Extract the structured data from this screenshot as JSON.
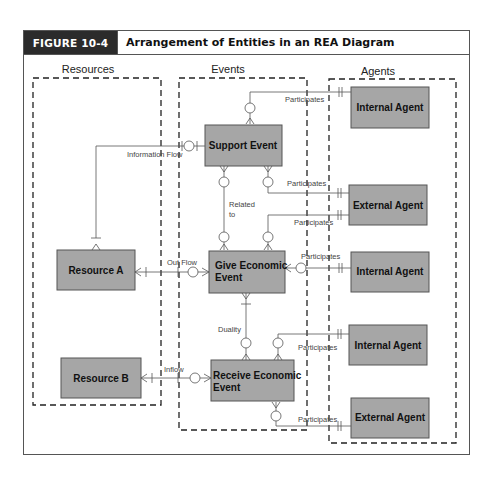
{
  "header": {
    "figure_label": "FIGURE 10-4",
    "title": "Arrangement of Entities in an REA Diagram"
  },
  "columns": {
    "resources": "Resources",
    "events": "Events",
    "agents": "Agents"
  },
  "entities": {
    "resource_a": "Resource A",
    "resource_b": "Resource B",
    "support_event": "Support Event",
    "give_event_line1": "Give Economic",
    "give_event_line2": "Event",
    "receive_event_line1": "Receive Economic",
    "receive_event_line2": "Event",
    "internal_agent_1": "Internal Agent",
    "external_agent_1": "External Agent",
    "internal_agent_2": "Internal Agent",
    "internal_agent_3": "Internal Agent",
    "external_agent_2": "External Agent"
  },
  "relationships": {
    "information_flow": "Information Flow",
    "related_to_line1": "Related",
    "related_to_line2": "to",
    "out_flow": "Out Flow",
    "inflow": "Inflow",
    "duality": "Duality",
    "participates_1": "Participates",
    "participates_2": "Participates",
    "participates_3": "Participates",
    "participates_4": "Participates",
    "participates_5": "Participates",
    "participates_6": "Participates"
  },
  "colors": {
    "entity_fill": "#a6a6a6",
    "header_label_bg": "#2b2b2b"
  }
}
